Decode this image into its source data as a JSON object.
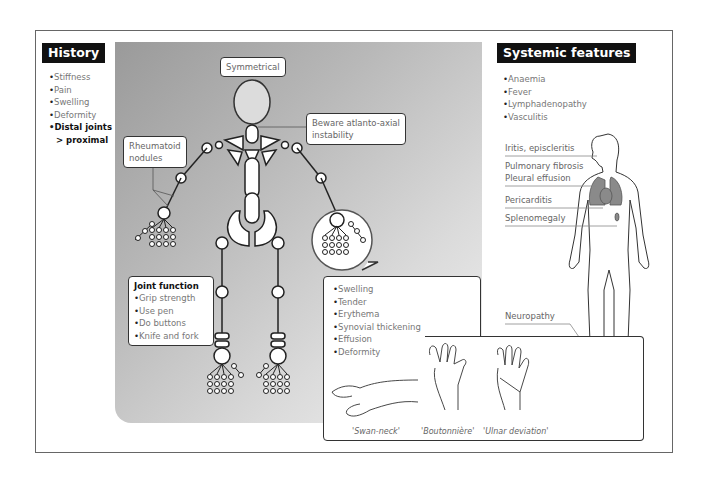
{
  "history": {
    "title": "History",
    "items": [
      "Stiffness",
      "Pain",
      "Swelling",
      "Deformity"
    ],
    "emphasis_line1": "Distal joints",
    "emphasis_line2": "> proximal"
  },
  "skeleton": {
    "symmetrical_label": "Symmetrical",
    "atlanto_label_line1": "Beware atlanto-axial",
    "atlanto_label_line2": "instability",
    "nodules_label_line1": "Rheumatoid",
    "nodules_label_line2": "nodules",
    "fill_color": "#ffffff",
    "head_color": "#dcdcdc"
  },
  "joint_function": {
    "title": "Joint function",
    "items": [
      "Grip strength",
      "Use pen",
      "Do buttons",
      "Knife and fork"
    ]
  },
  "joint_signs": {
    "items": [
      "Swelling",
      "Tender",
      "Erythema",
      "Synovial thickening",
      "Effusion",
      "Deformity"
    ],
    "hand_captions": [
      "'Swan-neck'",
      "'Boutonnière'",
      "'Ulnar deviation'"
    ]
  },
  "systemic": {
    "title": "Systemic features",
    "items": [
      "Anaemia",
      "Fever",
      "Lymphadenopathy",
      "Vasculitis"
    ],
    "labels": {
      "eye": "Iritis, episcleritis",
      "lung1": "Pulmonary fibrosis",
      "lung2": "Pleural effusion",
      "heart": "Pericarditis",
      "spleen": "Splenomegaly",
      "nerve": "Neuropathy"
    },
    "organ_color": "#8a8a8a"
  }
}
